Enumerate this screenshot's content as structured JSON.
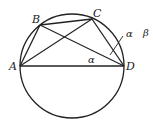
{
  "diagram": {
    "type": "circle-inscribed-quadrilateral",
    "circle": {
      "cx": 72,
      "cy": 66,
      "r": 52
    },
    "points": {
      "A": {
        "label": "A",
        "x": 20,
        "y": 66
      },
      "B": {
        "label": "B",
        "x": 40,
        "y": 25
      },
      "C": {
        "label": "C",
        "x": 92,
        "y": 19
      },
      "D": {
        "label": "D",
        "x": 124,
        "y": 66
      }
    },
    "segments": [
      "AB",
      "BC",
      "CD",
      "AD",
      "AC",
      "BD"
    ],
    "angle_labels": {
      "alpha_ad": "α",
      "alpha_cd": "α",
      "beta": "β"
    },
    "stroke_color": "#222222"
  }
}
